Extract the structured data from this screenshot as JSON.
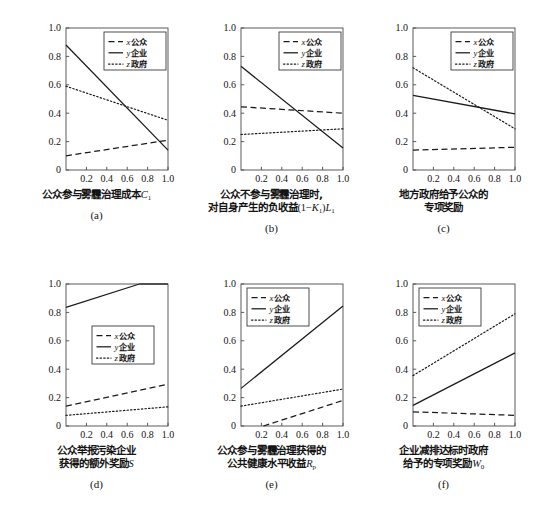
{
  "figure": {
    "rows": 2,
    "cols": 3,
    "background": "#ffffff",
    "line_color": "#1a1a1a"
  },
  "legend": {
    "entries": [
      {
        "symbol": "x",
        "label": "公众",
        "style": "dashed",
        "key": "x"
      },
      {
        "symbol": "y",
        "label": "企业",
        "style": "solid",
        "key": "y"
      },
      {
        "symbol": "z",
        "label": "政府",
        "style": "dotted",
        "key": "z"
      }
    ]
  },
  "axis": {
    "xticks": [
      "0.2",
      "0.4",
      "0.6",
      "0.8",
      "1.0"
    ],
    "xtick_values": [
      0.2,
      0.4,
      0.6,
      0.8,
      1.0
    ],
    "yticks": [
      "0",
      "0.2",
      "0.4",
      "0.6",
      "0.8",
      "1.0"
    ],
    "ytick_values": [
      0,
      0.2,
      0.4,
      0.6,
      0.8,
      1.0
    ],
    "xlim": [
      0,
      1.0
    ],
    "ylim": [
      0,
      1.0
    ]
  },
  "chart_data": [
    {
      "id": "a",
      "type": "line",
      "panel": "(a)",
      "xlabel_lines": [
        "公众参与雾霾治理成本C1"
      ],
      "xlabel_plain": "公众参与雾霾治理成本 C₁",
      "ylabel": "",
      "x": [
        0,
        1.0
      ],
      "xlim": [
        0,
        1.0
      ],
      "ylim": [
        0,
        1.0
      ],
      "grid": false,
      "legend_position": "top-right",
      "series": [
        {
          "name": "x公众",
          "style": "dashed",
          "values": [
            0.1,
            0.21
          ]
        },
        {
          "name": "y企业",
          "style": "solid",
          "values": [
            0.88,
            0.14
          ]
        },
        {
          "name": "z政府",
          "style": "dotted",
          "values": [
            0.59,
            0.35
          ]
        }
      ]
    },
    {
      "id": "b",
      "type": "line",
      "panel": "(b)",
      "xlabel_lines": [
        "公众不参与雾霾治理时,",
        "对自身产生的负收益(1-K1)L1"
      ],
      "xlabel_plain": "公众不参与雾霾治理时,对自身产生的负收益(1−K₁)L₁",
      "ylabel": "",
      "x": [
        0,
        1.0
      ],
      "xlim": [
        0,
        1.0
      ],
      "ylim": [
        0,
        1.0
      ],
      "grid": false,
      "legend_position": "top-right",
      "series": [
        {
          "name": "x公众",
          "style": "dashed",
          "values": [
            0.445,
            0.4
          ]
        },
        {
          "name": "y企业",
          "style": "solid",
          "values": [
            0.73,
            0.155
          ]
        },
        {
          "name": "z政府",
          "style": "dotted",
          "values": [
            0.25,
            0.29
          ]
        }
      ]
    },
    {
      "id": "c",
      "type": "line",
      "panel": "(c)",
      "xlabel_lines": [
        "地方政府给予公众的",
        "专项奖励"
      ],
      "xlabel_plain": "地方政府给予公众的专项奖励",
      "ylabel": "",
      "x": [
        0,
        1.0
      ],
      "xlim": [
        0,
        1.0
      ],
      "ylim": [
        0,
        1.0
      ],
      "grid": false,
      "legend_position": "top-right",
      "series": [
        {
          "name": "x公众",
          "style": "dashed",
          "values": [
            0.14,
            0.16
          ]
        },
        {
          "name": "y企业",
          "style": "solid",
          "values": [
            0.525,
            0.395
          ]
        },
        {
          "name": "z政府",
          "style": "dotted",
          "values": [
            0.72,
            0.29
          ]
        }
      ]
    },
    {
      "id": "d",
      "type": "line",
      "panel": "(d)",
      "xlabel_lines": [
        "公众举报污染企业",
        "获得的额外奖励S"
      ],
      "xlabel_plain": "公众举报污染企业获得的额外奖励 S",
      "ylabel": "",
      "x": [
        0,
        1.0
      ],
      "xlim": [
        0,
        1.0
      ],
      "ylim": [
        0,
        1.0
      ],
      "grid": false,
      "legend_position": "middle-right",
      "series": [
        {
          "name": "x公众",
          "style": "dashed",
          "values": [
            0.14,
            0.295
          ]
        },
        {
          "name": "y企业",
          "style": "solid",
          "values": [
            0.835,
            1.0
          ],
          "clip_at_x": 0.72
        },
        {
          "name": "z政府",
          "style": "dotted",
          "values": [
            0.075,
            0.135
          ]
        }
      ]
    },
    {
      "id": "e",
      "type": "line",
      "panel": "(e)",
      "xlabel_lines": [
        "公众参与雾霾治理获得的",
        "公共健康水平收益Rp"
      ],
      "xlabel_plain": "公众参与雾霾治理获得的公共健康水平收益 R_p",
      "ylabel": "",
      "x": [
        0,
        1.0
      ],
      "xlim": [
        0,
        1.0
      ],
      "ylim": [
        0,
        1.0
      ],
      "grid": false,
      "legend_position": "top-left",
      "series": [
        {
          "name": "x公众",
          "style": "dashed",
          "values": [
            -0.055,
            0.18
          ],
          "start_x": 0.22
        },
        {
          "name": "y企业",
          "style": "solid",
          "values": [
            0.265,
            0.845
          ]
        },
        {
          "name": "z政府",
          "style": "dotted",
          "values": [
            0.14,
            0.26
          ]
        }
      ]
    },
    {
      "id": "f",
      "type": "line",
      "panel": "(f)",
      "xlabel_lines": [
        "企业减排达标时政府",
        "给予的专项奖励W0"
      ],
      "xlabel_plain": "企业减排达标时政府给予的专项奖励 W₀",
      "ylabel": "",
      "x": [
        0,
        1.0
      ],
      "xlim": [
        0,
        1.0
      ],
      "ylim": [
        0,
        1.0
      ],
      "grid": false,
      "legend_position": "top-left",
      "series": [
        {
          "name": "x公众",
          "style": "dashed",
          "values": [
            0.1,
            0.075
          ]
        },
        {
          "name": "y企业",
          "style": "solid",
          "values": [
            0.145,
            0.515
          ]
        },
        {
          "name": "z政府",
          "style": "dotted",
          "values": [
            0.355,
            0.79
          ]
        }
      ]
    }
  ]
}
